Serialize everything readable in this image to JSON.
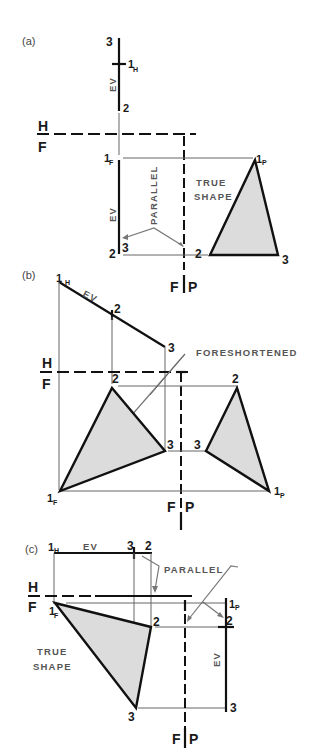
{
  "figure": {
    "panels": [
      {
        "id": "a",
        "caption": "(a)",
        "fold_lines": {
          "upper": "H",
          "lower": "F",
          "right_left": "F",
          "right_right": "P"
        },
        "point_labels": {
          "p3_top": "3",
          "p1_h": "1",
          "p1_h_sub": "H",
          "p2_top": "2",
          "p1_f": "1",
          "p1_f_sub": "F",
          "p2_f": "2",
          "p3_f": "3",
          "p1_p": "1",
          "p1_p_sub": "P",
          "p2_p": "2",
          "p3_p": "3"
        },
        "annotations": {
          "ev_top": "EV",
          "ev_front": "EV",
          "parallel": "PARALLEL",
          "true_shape_1": "TRUE",
          "true_shape_2": "SHAPE"
        }
      },
      {
        "id": "b",
        "caption": "(b)",
        "fold_lines": {
          "upper": "H",
          "lower": "F",
          "right_left": "F",
          "right_right": "P"
        },
        "point_labels": {
          "p1_h": "1",
          "p1_h_sub": "H",
          "p2_h": "2",
          "p3_h": "3",
          "p2_f": "2",
          "p3_f": "3",
          "p1_f": "1",
          "p1_f_sub": "F",
          "p2_p": "2",
          "p3_p": "3",
          "p1_p": "1",
          "p1_p_sub": "P"
        },
        "annotations": {
          "ev": "EV",
          "foreshortened": "FORESHORTENED"
        }
      },
      {
        "id": "c",
        "caption": "(c)",
        "fold_lines": {
          "upper": "H",
          "lower": "F",
          "right_left": "F",
          "right_right": "P"
        },
        "point_labels": {
          "p1_h": "1",
          "p1_h_sub": "H",
          "p3_h": "3",
          "p2_h": "2",
          "p1_f": "1",
          "p1_f_sub": "F",
          "p2_f": "2",
          "p3_f": "3",
          "p1_p": "1",
          "p1_p_sub": "P",
          "p2_p": "2",
          "p3_p": "3"
        },
        "annotations": {
          "ev_top": "EV",
          "ev_side": "EV",
          "parallel": "PARALLEL",
          "true_shape_1": "TRUE",
          "true_shape_2": "SHAPE"
        }
      }
    ],
    "colors": {
      "line": "#111111",
      "projection": "#666666",
      "fill": "#dcdcdc",
      "note": "#555555"
    }
  }
}
